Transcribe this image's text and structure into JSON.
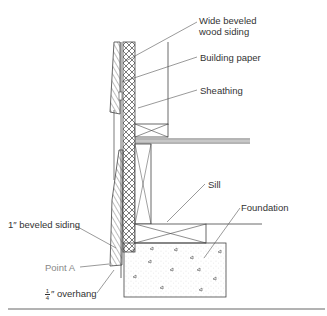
{
  "diagram": {
    "type": "wall-section",
    "labels": {
      "wide_siding_line1": "Wide beveled",
      "wide_siding_line2": "wood siding",
      "building_paper": "Building paper",
      "sheathing": "Sheathing",
      "sill": "Sill",
      "foundation": "Foundation",
      "beveled_siding": "1″ beveled siding",
      "point_a": "Point A",
      "overhang_num": "1",
      "overhang_den": "4",
      "overhang_text": "″ overhang"
    },
    "colors": {
      "line": "#444444",
      "text": "#333333",
      "muted_text": "#888888"
    }
  }
}
